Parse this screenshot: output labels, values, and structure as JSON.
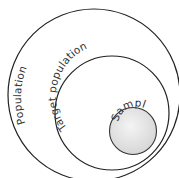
{
  "diagram": {
    "type": "nested-circles",
    "circles": [
      {
        "id": "population",
        "label": "Population",
        "cx": 94,
        "cy": 95,
        "r": 86,
        "fill": "#ffffff",
        "stroke": "#222222"
      },
      {
        "id": "target-population",
        "label": "Target population",
        "cx": 112,
        "cy": 113,
        "r": 57,
        "fill": "#ffffff",
        "stroke": "#222222"
      },
      {
        "id": "sample",
        "label": "Sample",
        "cx": 133,
        "cy": 131,
        "r": 23.5,
        "fill": "#e6e6e6",
        "stroke": "#333333"
      }
    ]
  }
}
